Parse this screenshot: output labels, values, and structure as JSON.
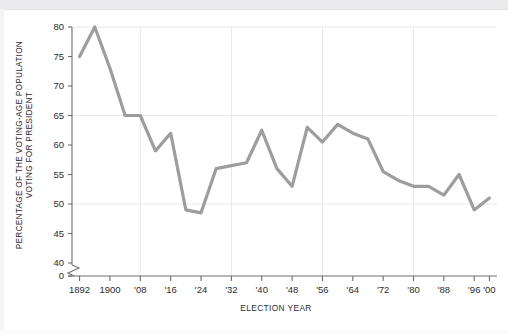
{
  "chart_data": {
    "type": "line",
    "title": "",
    "xlabel": "ELECTION  YEAR",
    "ylabel_lines": [
      "PERCENTAGE OF THE VOTING-AGE POPULATION",
      "VOTING FOR PRESIDENT"
    ],
    "ylabel": "PERCENTAGE OF THE VOTING-AGE POPULATION VOTING FOR PRESIDENT",
    "x": [
      1892,
      1896,
      1900,
      1904,
      1908,
      1912,
      1916,
      1920,
      1924,
      1928,
      1932,
      1936,
      1940,
      1944,
      1948,
      1952,
      1956,
      1960,
      1964,
      1968,
      1972,
      1976,
      1980,
      1984,
      1988,
      1992,
      1996,
      2000
    ],
    "values": [
      75,
      80,
      73,
      65,
      65,
      59,
      62,
      49,
      48.5,
      56,
      56.5,
      57,
      62.5,
      56,
      53,
      63,
      60.5,
      63.5,
      62,
      61,
      55.5,
      54,
      53,
      53,
      51.5,
      55,
      49,
      51
    ],
    "ylim": [
      0,
      80
    ],
    "y_break": {
      "between": [
        40,
        0
      ],
      "label": "axis break"
    },
    "yticks": [
      "80",
      "75",
      "70",
      "65",
      "60",
      "55",
      "50",
      "45",
      "40",
      "0"
    ],
    "ytick_values": [
      80,
      75,
      70,
      65,
      60,
      55,
      50,
      45,
      40,
      0
    ],
    "gridlines_y": [
      80,
      65,
      50
    ],
    "gridlines_x": [
      1908,
      1932,
      1956,
      1980
    ],
    "xticks": [
      "1892",
      "1900",
      "'08",
      "'16",
      "'24",
      "'32",
      "'40",
      "'48",
      "'56",
      "'64",
      "'72",
      "'80",
      "'88",
      "'96",
      "'00"
    ],
    "xtick_values": [
      1892,
      1900,
      1908,
      1916,
      1924,
      1932,
      1940,
      1948,
      1956,
      1964,
      1972,
      1980,
      1988,
      1996,
      2000
    ],
    "legend": [],
    "grid": true,
    "line_color": "#9d9d9d",
    "grid_color": "#e8e8ea",
    "axis_color": "#6e6e72",
    "text_color": "#2b2b2f",
    "background": "#ffffff"
  }
}
